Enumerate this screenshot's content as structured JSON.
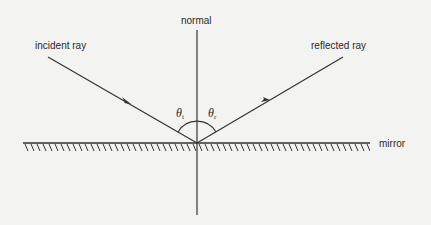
{
  "diagram": {
    "labels": {
      "normal": "normal",
      "incident": "incident ray",
      "reflected": "reflected ray",
      "mirror": "mirror"
    },
    "angles": {
      "incident_symbol": "θ",
      "incident_sub": "i",
      "reflected_symbol": "θ",
      "reflected_sub": "r"
    },
    "colors": {
      "background": "#f3f3f1",
      "line": "#333333",
      "text": "#2a2a2a"
    }
  }
}
